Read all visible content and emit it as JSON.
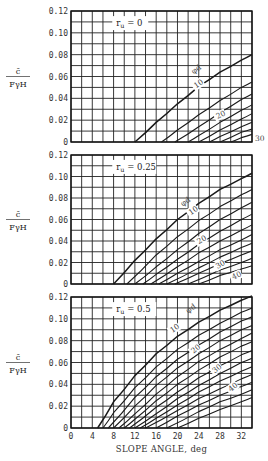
{
  "chart_data": [
    {
      "type": "line",
      "panel": 1,
      "annotation": "r_u = 0",
      "ylabel_num": "c̄",
      "ylabel_den": "FγH",
      "yticks": [
        "0",
        "0.02",
        "0.04",
        "0.06",
        "0.08",
        "0.10",
        "0.12"
      ],
      "ylim": [
        0,
        0.12
      ],
      "xlim": [
        0,
        34
      ],
      "grid": true,
      "family_label": "φd",
      "curve_labels": [
        "10",
        "20",
        "30"
      ],
      "series": [
        {
          "name": "φd=5",
          "x": [
            12,
            16,
            20,
            24,
            28,
            32,
            34
          ],
          "y": [
            0,
            0.018,
            0.035,
            0.051,
            0.064,
            0.075,
            0.08
          ]
        },
        {
          "name": "φd=10",
          "x": [
            17,
            20,
            24,
            28,
            32,
            34
          ],
          "y": [
            0,
            0.011,
            0.025,
            0.038,
            0.05,
            0.055
          ]
        },
        {
          "name": "φd=15",
          "x": [
            19.5,
            24,
            28,
            32,
            34
          ],
          "y": [
            0,
            0.014,
            0.027,
            0.039,
            0.044
          ]
        },
        {
          "name": "φd=20",
          "x": [
            22,
            24,
            28,
            32,
            34
          ],
          "y": [
            0,
            0.006,
            0.018,
            0.029,
            0.034
          ]
        },
        {
          "name": "φd=25",
          "x": [
            24,
            28,
            32,
            34
          ],
          "y": [
            0,
            0.011,
            0.021,
            0.026
          ]
        },
        {
          "name": "φd=30",
          "x": [
            26,
            28,
            32,
            34
          ],
          "y": [
            0,
            0.005,
            0.014,
            0.018
          ]
        },
        {
          "name": "φd=35",
          "x": [
            28,
            32,
            34
          ],
          "y": [
            0,
            0.009,
            0.012
          ]
        },
        {
          "name": "φd=40",
          "x": [
            30,
            32,
            34
          ],
          "y": [
            0,
            0.004,
            0.007
          ]
        }
      ]
    },
    {
      "type": "line",
      "panel": 2,
      "annotation": "r_u = 0.25",
      "ylabel_num": "c̄",
      "ylabel_den": "FγH",
      "yticks": [
        "0",
        "0.02",
        "0.04",
        "0.06",
        "0.08",
        "0.10",
        "0.12"
      ],
      "ylim": [
        0,
        0.12
      ],
      "xlim": [
        0,
        34
      ],
      "grid": true,
      "family_label": "φd",
      "curve_labels": [
        "10",
        "20",
        "30",
        "40"
      ],
      "series": [
        {
          "name": "φd=5",
          "x": [
            8,
            12,
            16,
            20,
            24,
            28,
            32,
            34
          ],
          "y": [
            0,
            0.022,
            0.042,
            0.06,
            0.075,
            0.088,
            0.098,
            0.103
          ]
        },
        {
          "name": "φd=10",
          "x": [
            10.5,
            16,
            20,
            24,
            28,
            32,
            34
          ],
          "y": [
            0,
            0.027,
            0.044,
            0.059,
            0.072,
            0.083,
            0.088
          ]
        },
        {
          "name": "φd=15",
          "x": [
            12,
            16,
            20,
            24,
            28,
            32,
            34
          ],
          "y": [
            0,
            0.016,
            0.032,
            0.047,
            0.06,
            0.071,
            0.076
          ]
        },
        {
          "name": "φd=20",
          "x": [
            13.5,
            16,
            20,
            24,
            28,
            32,
            34
          ],
          "y": [
            0,
            0.009,
            0.023,
            0.037,
            0.049,
            0.06,
            0.065
          ]
        },
        {
          "name": "φd=25",
          "x": [
            15,
            20,
            24,
            28,
            32,
            34
          ],
          "y": [
            0,
            0.016,
            0.029,
            0.04,
            0.05,
            0.055
          ]
        },
        {
          "name": "φd=30",
          "x": [
            16.5,
            20,
            24,
            28,
            32,
            34
          ],
          "y": [
            0,
            0.01,
            0.021,
            0.032,
            0.041,
            0.046
          ]
        },
        {
          "name": "φd=35",
          "x": [
            18,
            24,
            28,
            32,
            34
          ],
          "y": [
            0,
            0.015,
            0.025,
            0.034,
            0.038
          ]
        },
        {
          "name": "φd=40",
          "x": [
            19.5,
            24,
            28,
            32,
            34
          ],
          "y": [
            0,
            0.01,
            0.019,
            0.027,
            0.031
          ]
        },
        {
          "name": "φd=45",
          "x": [
            22,
            28,
            32,
            34
          ],
          "y": [
            0,
            0.013,
            0.02,
            0.024
          ]
        },
        {
          "name": "φd=50",
          "x": [
            24,
            28,
            32,
            34
          ],
          "y": [
            0,
            0.008,
            0.014,
            0.017
          ]
        }
      ]
    },
    {
      "type": "line",
      "panel": 3,
      "annotation": "r_u = 0.5",
      "ylabel_num": "c̄",
      "ylabel_den": "FγH",
      "yticks": [
        "0",
        "0.02",
        "0.04",
        "0.06",
        "0.08",
        "0.10",
        "0.12"
      ],
      "ylim": [
        0,
        0.12
      ],
      "xlim": [
        0,
        34
      ],
      "xticks": [
        "0",
        "4",
        "8",
        "12",
        "16",
        "20",
        "24",
        "28",
        "32"
      ],
      "xlabel": "SLOPE ANGLE, deg",
      "grid": true,
      "family_label": "φd",
      "curve_labels": [
        "10",
        "20",
        "30",
        "40"
      ],
      "series": [
        {
          "name": "φd=5",
          "x": [
            5,
            8,
            12,
            16,
            20,
            24,
            28,
            32,
            34
          ],
          "y": [
            0,
            0.024,
            0.048,
            0.068,
            0.084,
            0.097,
            0.108,
            0.117,
            0.121
          ]
        },
        {
          "name": "φd=10",
          "x": [
            6,
            8,
            12,
            16,
            20,
            24,
            28,
            32,
            34
          ],
          "y": [
            0,
            0.014,
            0.037,
            0.056,
            0.072,
            0.085,
            0.096,
            0.106,
            0.11
          ]
        },
        {
          "name": "φd=15",
          "x": [
            7,
            12,
            16,
            20,
            24,
            28,
            32,
            34
          ],
          "y": [
            0,
            0.028,
            0.047,
            0.063,
            0.076,
            0.088,
            0.098,
            0.102
          ]
        },
        {
          "name": "φd=20",
          "x": [
            8,
            12,
            16,
            20,
            24,
            28,
            32,
            34
          ],
          "y": [
            0,
            0.02,
            0.039,
            0.055,
            0.068,
            0.08,
            0.09,
            0.094
          ]
        },
        {
          "name": "φd=25",
          "x": [
            9,
            12,
            16,
            20,
            24,
            28,
            32,
            34
          ],
          "y": [
            0,
            0.013,
            0.031,
            0.047,
            0.061,
            0.072,
            0.082,
            0.087
          ]
        },
        {
          "name": "φd=30",
          "x": [
            10,
            12,
            16,
            20,
            24,
            28,
            32,
            34
          ],
          "y": [
            0,
            0.008,
            0.025,
            0.04,
            0.053,
            0.065,
            0.075,
            0.079
          ]
        },
        {
          "name": "φd=35",
          "x": [
            11,
            16,
            20,
            24,
            28,
            32,
            34
          ],
          "y": [
            0,
            0.019,
            0.033,
            0.046,
            0.057,
            0.067,
            0.071
          ]
        },
        {
          "name": "φd=40",
          "x": [
            12,
            16,
            20,
            24,
            28,
            32,
            34
          ],
          "y": [
            0,
            0.013,
            0.027,
            0.039,
            0.05,
            0.06,
            0.064
          ]
        },
        {
          "name": "φd=45",
          "x": [
            13,
            16,
            20,
            24,
            28,
            32,
            34
          ],
          "y": [
            0,
            0.009,
            0.021,
            0.033,
            0.043,
            0.052,
            0.056
          ]
        },
        {
          "name": "φd=50",
          "x": [
            14,
            20,
            24,
            28,
            32,
            34
          ],
          "y": [
            0,
            0.016,
            0.027,
            0.036,
            0.045,
            0.049
          ]
        },
        {
          "name": "φd=55",
          "x": [
            16,
            20,
            24,
            28,
            32,
            34
          ],
          "y": [
            0,
            0.011,
            0.021,
            0.03,
            0.038,
            0.042
          ]
        },
        {
          "name": "φd=60",
          "x": [
            18,
            24,
            28,
            32,
            34
          ],
          "y": [
            0,
            0.015,
            0.024,
            0.031,
            0.035
          ]
        },
        {
          "name": "φd=65",
          "x": [
            20,
            24,
            28,
            32,
            34
          ],
          "y": [
            0,
            0.009,
            0.017,
            0.024,
            0.028
          ]
        }
      ]
    }
  ],
  "colors": {
    "line": "#1a1a1a",
    "grid": "#222222",
    "label_bg": "#ffffff",
    "text": "#333333"
  },
  "caption": "Stability chart (partial, cut off)"
}
